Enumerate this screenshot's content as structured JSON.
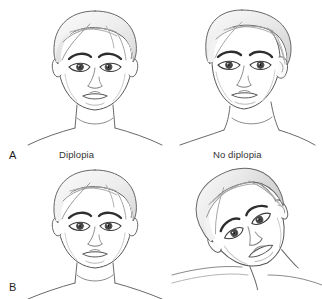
{
  "figure": {
    "panels": [
      {
        "letter": "A",
        "letter_name": "panel-letter-a",
        "columns": [
          {
            "label": "Diplopia",
            "head": "upright-head-eyes-misaligned"
          },
          {
            "label": "No diplopia",
            "head": "turned-head-eyes-aligned"
          }
        ]
      },
      {
        "letter": "B",
        "letter_name": "panel-letter-b",
        "columns": [
          {
            "label": "",
            "head": "upright-head-eyes-misaligned"
          },
          {
            "label": "",
            "head": "tilted-head-eyes-aligned"
          }
        ]
      }
    ],
    "labels": {
      "panel_a": "A",
      "panel_b": "B",
      "column_left": "Diplopia",
      "column_right": "No diplopia"
    },
    "colors": {
      "background": "#ffffff",
      "outline": "#555555",
      "skin_fill": "#ffffff",
      "hair_light": "#f4f4f4",
      "hair_mid": "#e4e4e4",
      "hair_shadow": "#cfcfcf",
      "iris": "#3a3a3a",
      "pupil": "#1a1a1a",
      "brow": "#2e2e2e",
      "text": "#2b2b2b"
    }
  }
}
